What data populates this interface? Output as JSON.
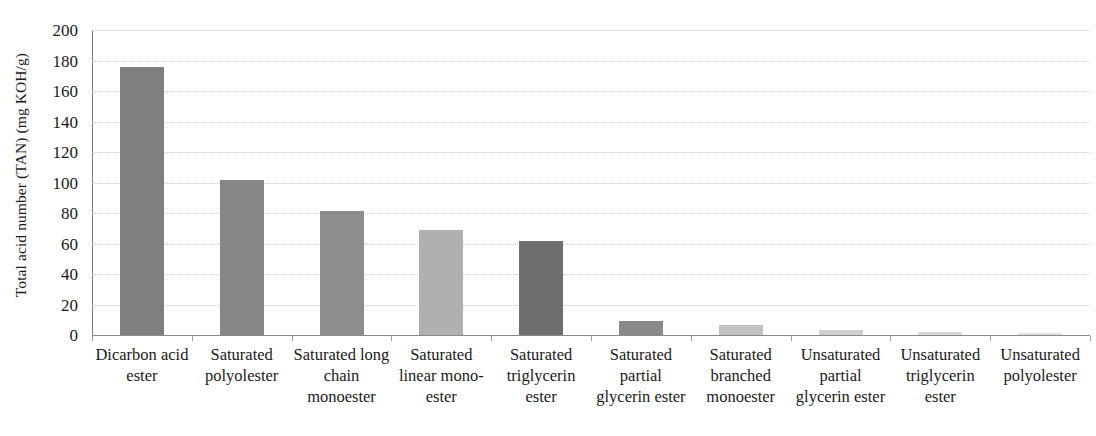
{
  "chart_data": {
    "type": "bar",
    "title": "",
    "subtitle": "",
    "xlabel": "",
    "ylabel": "Total acid number (TAN) (mg KOH/g)",
    "ylim": [
      0,
      200
    ],
    "yticks": [
      0,
      20,
      40,
      60,
      80,
      100,
      120,
      140,
      160,
      180,
      200
    ],
    "ytick_labels": [
      "0",
      "20",
      "40",
      "60",
      "80",
      "100",
      "120",
      "140",
      "160",
      "180",
      "200"
    ],
    "grid": true,
    "grid_axis": "y",
    "legend": false,
    "legend_position": "none",
    "categories": [
      "Dicarbon acid ester",
      "Saturated polyolester",
      "Saturated long chain monoester",
      "Saturated linear mono-ester",
      "Saturated triglycerin ester",
      "Saturated partial glycerin ester",
      "Saturated branched monoester",
      "Unsaturated partial glycerin ester",
      "Unsaturated triglycerin ester",
      "Unsaturated polyolester"
    ],
    "values": [
      175.5,
      101.5,
      81.5,
      69,
      61.5,
      9.2,
      6.5,
      3,
      2,
      1
    ],
    "bar_colors": [
      "#7f7f7f",
      "#868686",
      "#8d8d8d",
      "#b0b0b0",
      "#6e6e6e",
      "#8a8a8a",
      "#c2c2c2",
      "#cfcfcf",
      "#d6d6d6",
      "#dedede"
    ]
  },
  "axis": {
    "y_title": "Total acid number (TAN) (mg KOH/g)"
  }
}
